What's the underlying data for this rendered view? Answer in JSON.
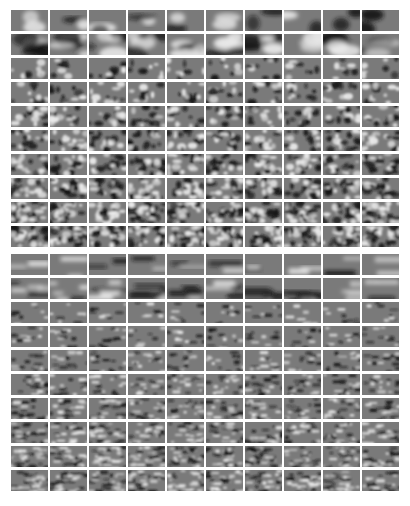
{
  "figure": {
    "blocks": [
      {
        "name": "top-block",
        "rows": 10,
        "cols": 10,
        "style": "blob"
      },
      {
        "name": "bottom-block",
        "rows": 10,
        "cols": 10,
        "style": "stripe"
      }
    ],
    "colors": {
      "background": "#ffffff",
      "tile_mid_gray": "#7a7a7a",
      "dark": "#141414",
      "light": "#f0f0f0"
    }
  }
}
